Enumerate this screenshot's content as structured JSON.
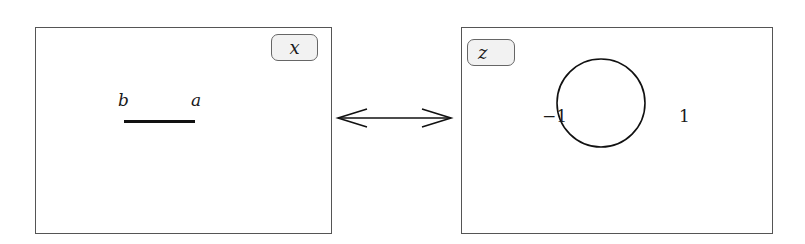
{
  "left_panel": {
    "tag": "x",
    "segment": {
      "label_left": "b",
      "label_right": "a"
    }
  },
  "right_panel": {
    "tag": "z",
    "circle": {
      "label_left": "−1",
      "label_right": "1"
    }
  },
  "connector": {
    "type": "double-headed-arrow"
  }
}
